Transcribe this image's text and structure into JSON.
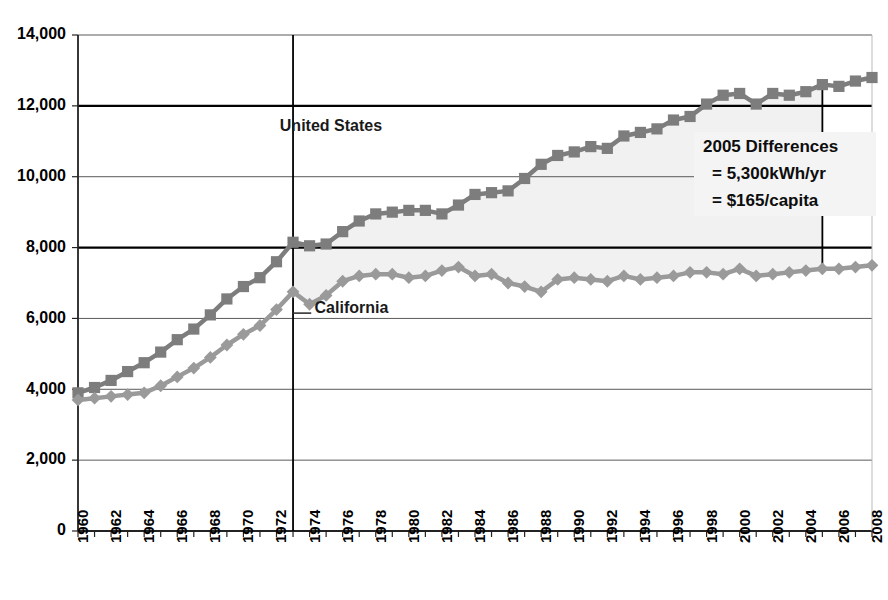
{
  "chart_data": {
    "type": "line",
    "title": "",
    "subtitle": "",
    "xlabel": "",
    "ylabel": "",
    "xlim": [
      1960,
      2008
    ],
    "ylim": [
      0,
      14000
    ],
    "ytick_step": 2000,
    "xtick_step": 1,
    "xlabel_step": 2,
    "grid": true,
    "legend_position": "inline-annotation",
    "ytick_labels": [
      "0",
      "2,000",
      "4,000",
      "6,000",
      "8,000",
      "10,000",
      "12,000",
      "14,000"
    ],
    "ytick_values": [
      0,
      2000,
      4000,
      6000,
      8000,
      10000,
      12000,
      14000
    ],
    "xtick_labels": [
      "1960",
      "1962",
      "1964",
      "1966",
      "1968",
      "1970",
      "1972",
      "1974",
      "1976",
      "1978",
      "1980",
      "1982",
      "1984",
      "1986",
      "1988",
      "1990",
      "1992",
      "1994",
      "1996",
      "1998",
      "2000",
      "2002",
      "2004",
      "2006",
      "2008"
    ],
    "x": [
      1960,
      1961,
      1962,
      1963,
      1964,
      1965,
      1966,
      1967,
      1968,
      1969,
      1970,
      1971,
      1972,
      1973,
      1974,
      1975,
      1976,
      1977,
      1978,
      1979,
      1980,
      1981,
      1982,
      1983,
      1984,
      1985,
      1986,
      1987,
      1988,
      1989,
      1990,
      1991,
      1992,
      1993,
      1994,
      1995,
      1996,
      1997,
      1998,
      1999,
      2000,
      2001,
      2002,
      2003,
      2004,
      2005,
      2006,
      2007,
      2008
    ],
    "series": [
      {
        "name": "United States",
        "marker": "square",
        "color": "#7d7d7d",
        "values": [
          3900,
          4050,
          4250,
          4500,
          4750,
          5050,
          5400,
          5700,
          6100,
          6550,
          6900,
          7150,
          7600,
          8150,
          8050,
          8100,
          8450,
          8750,
          8950,
          9000,
          9050,
          9050,
          8950,
          9200,
          9500,
          9550,
          9600,
          9950,
          10350,
          10600,
          10700,
          10850,
          10800,
          11150,
          11250,
          11350,
          11600,
          11700,
          12050,
          12300,
          12350,
          12050,
          12350,
          12300,
          12400,
          12600,
          12550,
          12700,
          12800
        ]
      },
      {
        "name": "California",
        "marker": "diamond",
        "color": "#9a9a9a",
        "values": [
          3700,
          3750,
          3800,
          3850,
          3900,
          4100,
          4350,
          4600,
          4900,
          5250,
          5550,
          5800,
          6250,
          6750,
          6400,
          6650,
          7050,
          7200,
          7250,
          7250,
          7150,
          7200,
          7350,
          7450,
          7200,
          7250,
          7000,
          6900,
          6750,
          7100,
          7150,
          7100,
          7050,
          7200,
          7100,
          7150,
          7200,
          7300,
          7300,
          7250,
          7400,
          7200,
          7250,
          7300,
          7350,
          7400,
          7400,
          7450,
          7500
        ]
      }
    ],
    "area_fill": {
      "between": [
        "United States",
        "California"
      ],
      "color": "#f1f1f1",
      "from_year": 1973,
      "to_year": 2005
    },
    "annotations": [
      {
        "name": "united-states-label",
        "text": "United States",
        "x": 1972.2,
        "y": 11300
      },
      {
        "name": "california-label",
        "text": "California",
        "x": 1974.3,
        "y": 6150
      }
    ],
    "callout_box": {
      "line1": "2005 Differences",
      "line2": "= 5,300kWh/yr",
      "line3": "= $165/capita",
      "background": "#f4f4f4"
    },
    "reference_lines": [
      {
        "name": "oil-embargo-1973",
        "type": "vertical",
        "x": 1973
      },
      {
        "name": "difference-2005",
        "type": "vertical",
        "x": 2005
      }
    ]
  }
}
